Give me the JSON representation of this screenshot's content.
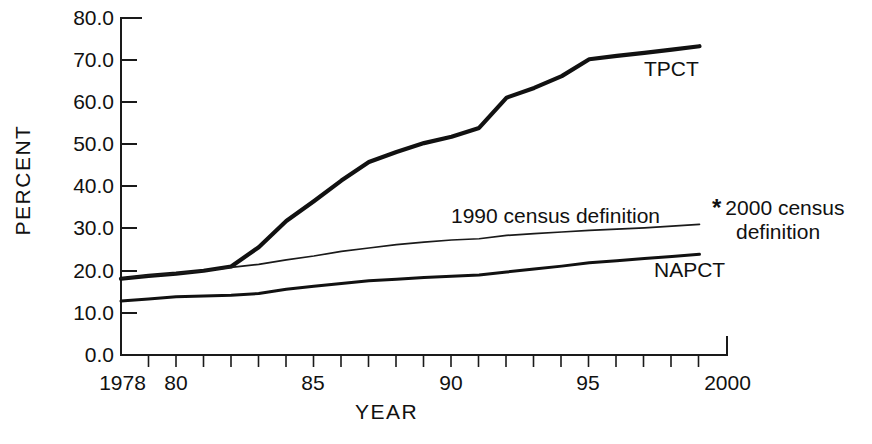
{
  "chart_data": {
    "type": "line",
    "title": "",
    "xlabel": "YEAR",
    "ylabel": "PERCENT",
    "xlim": [
      1978,
      2000
    ],
    "ylim": [
      0.0,
      80.0
    ],
    "grid": false,
    "legend_position": "inline-annotations",
    "y_ticks": [
      "0.0",
      "10.0",
      "20.0",
      "30.0",
      "40.0",
      "50.0",
      "60.0",
      "70.0",
      "80.0"
    ],
    "y_tick_values": [
      0.0,
      10.0,
      20.0,
      30.0,
      40.0,
      50.0,
      60.0,
      70.0,
      80.0
    ],
    "x_ticks": [
      "1978",
      "80",
      "85",
      "90",
      "95",
      "2000"
    ],
    "x_tick_values": [
      1978,
      1980,
      1985,
      1990,
      1995,
      2000
    ],
    "x_minor_interval": 1,
    "x": [
      1978,
      1979,
      1980,
      1981,
      1982,
      1983,
      1984,
      1985,
      1986,
      1987,
      1988,
      1989,
      1990,
      1991,
      1992,
      1993,
      1994,
      1995,
      1996,
      1997,
      1998,
      1999
    ],
    "series": [
      {
        "name": "TPCT",
        "label": "TPCT",
        "style": "thick",
        "values": [
          18.1,
          18.8,
          19.3,
          20.0,
          21.0,
          25.6,
          31.8,
          36.5,
          41.4,
          45.8,
          48.2,
          50.3,
          51.8,
          53.9,
          61.1,
          63.4,
          66.2,
          70.2,
          71.0,
          71.7,
          72.5,
          73.3
        ]
      },
      {
        "name": "1990 census definition",
        "label": "1990 census definition",
        "style": "thin",
        "values": [
          18.2,
          18.9,
          19.4,
          20.0,
          20.8,
          21.5,
          22.6,
          23.5,
          24.6,
          25.4,
          26.2,
          26.8,
          27.3,
          27.6,
          28.4,
          28.8,
          29.2,
          29.6,
          29.9,
          30.2,
          30.6,
          31.0
        ]
      },
      {
        "name": "NAPCT",
        "label": "NAPCT",
        "style": "medium",
        "values": [
          12.8,
          13.3,
          13.8,
          14.0,
          14.2,
          14.6,
          15.6,
          16.3,
          17.0,
          17.6,
          18.0,
          18.4,
          18.7,
          19.0,
          19.7,
          20.4,
          21.1,
          21.9,
          22.4,
          22.9,
          23.4,
          23.9
        ]
      }
    ],
    "annotations": [
      {
        "name": "footnote-2000-census",
        "marker": "*",
        "line1": "2000 census",
        "line2": "definition"
      }
    ]
  },
  "axes": {
    "y_title": "PERCENT",
    "x_title": "YEAR"
  },
  "colors": {
    "line": "#111111",
    "axis": "#1a1a1a",
    "background": "#ffffff"
  }
}
